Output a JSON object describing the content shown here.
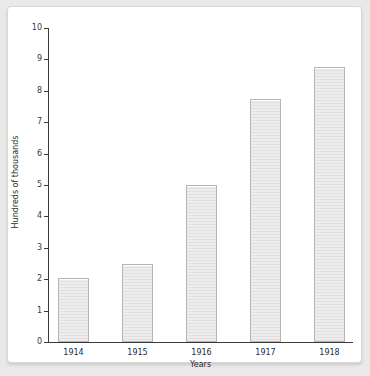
{
  "chart_data": {
    "type": "bar",
    "title": "",
    "subtitle": "",
    "xlabel": "Years",
    "ylabel": "Hundreds of thousands",
    "categories": [
      "1914",
      "1915",
      "1916",
      "1917",
      "1918"
    ],
    "values": [
      2.05,
      2.5,
      5.0,
      7.75,
      8.75
    ],
    "series": [
      {
        "name": "",
        "values": [
          2.05,
          2.5,
          5.0,
          7.75,
          8.75
        ]
      }
    ],
    "ylim": [
      0,
      10
    ],
    "y_ticks": [
      0,
      1,
      2,
      3,
      4,
      5,
      6,
      7,
      8,
      9,
      10
    ],
    "y_tick_labels": [
      "0",
      "1",
      "2",
      "3",
      "4",
      "5",
      "6",
      "7",
      "8",
      "9",
      "10"
    ],
    "grid": false,
    "legend": false,
    "legend_position": "none",
    "bar_fill_color": "#e8e8e8",
    "bar_border_color": "#b5b5b5",
    "axis_color": "#3a3a3a",
    "plot_background": "#ffffff",
    "page_background": "#e9e9e9",
    "annotations": []
  }
}
